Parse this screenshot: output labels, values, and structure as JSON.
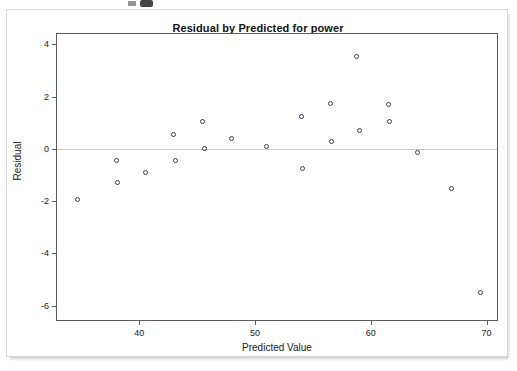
{
  "chart_data": {
    "type": "scatter",
    "title": "Residual by Predicted for power",
    "xlabel": "Predicted Value",
    "ylabel": "Residual",
    "xlim": [
      32.9,
      70.9
    ],
    "ylim": [
      -6.55,
      4.4
    ],
    "xticks": [
      40,
      50,
      60,
      70
    ],
    "yticks": [
      4,
      2,
      0,
      -2,
      -4,
      -6
    ],
    "xtick_labels": [
      "40",
      "50",
      "60",
      "70"
    ],
    "ytick_labels": [
      "4",
      "2",
      "0",
      "-2",
      "-4",
      "-6"
    ],
    "grid": false,
    "legend": null,
    "reference_line": {
      "orientation": "horizontal",
      "y": 0,
      "color": "#c9c9c9"
    },
    "marker": {
      "shape": "circle",
      "filled": false,
      "edge_color": "#3c3c5a",
      "size": 5
    },
    "x": [
      34.7,
      38.0,
      38.1,
      40.5,
      43.0,
      43.1,
      45.5,
      45.6,
      48.0,
      51.0,
      54.0,
      54.1,
      56.5,
      56.6,
      58.8,
      59.0,
      61.5,
      61.6,
      64.0,
      67.0,
      69.5
    ],
    "y": [
      -1.95,
      -0.45,
      -1.3,
      -0.9,
      0.55,
      -0.45,
      1.05,
      0.0,
      0.4,
      0.1,
      1.25,
      -0.75,
      1.75,
      0.3,
      3.55,
      0.7,
      1.7,
      1.05,
      -0.15,
      -1.5,
      -5.5
    ],
    "points": [
      {
        "x": 34.7,
        "y": -1.95
      },
      {
        "x": 38.0,
        "y": -0.45
      },
      {
        "x": 38.1,
        "y": -1.3
      },
      {
        "x": 40.5,
        "y": -0.9
      },
      {
        "x": 43.0,
        "y": 0.55
      },
      {
        "x": 43.1,
        "y": -0.45
      },
      {
        "x": 45.5,
        "y": 1.05
      },
      {
        "x": 45.6,
        "y": 0.0
      },
      {
        "x": 48.0,
        "y": 0.4
      },
      {
        "x": 51.0,
        "y": 0.1
      },
      {
        "x": 54.0,
        "y": 1.25
      },
      {
        "x": 54.1,
        "y": -0.75
      },
      {
        "x": 56.5,
        "y": 1.75
      },
      {
        "x": 56.6,
        "y": 0.3
      },
      {
        "x": 58.8,
        "y": 3.55
      },
      {
        "x": 59.0,
        "y": 0.7
      },
      {
        "x": 61.5,
        "y": 1.7
      },
      {
        "x": 61.6,
        "y": 1.05
      },
      {
        "x": 64.0,
        "y": -0.15
      },
      {
        "x": 67.0,
        "y": -1.5
      },
      {
        "x": 69.5,
        "y": -5.5
      }
    ]
  }
}
